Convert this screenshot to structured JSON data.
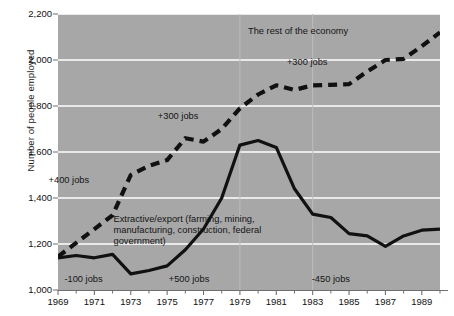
{
  "chart_data": {
    "type": "line",
    "title": "",
    "xlabel": "",
    "ylabel": "Number of people employed",
    "xlim": [
      1969,
      1990
    ],
    "ylim": [
      1000,
      2200
    ],
    "yticks": [
      1000,
      1200,
      1400,
      1600,
      1800,
      2000,
      2200
    ],
    "ytick_labels": [
      "1,000",
      "1,200",
      "1,400",
      "1,600",
      "1,800",
      "2,000",
      "2,200"
    ],
    "xticks": [
      1969,
      1971,
      1973,
      1975,
      1977,
      1979,
      1981,
      1983,
      1985,
      1987,
      1989
    ],
    "xtick_labels": [
      "1969",
      "1971",
      "1973",
      "1975",
      "1977",
      "1979",
      "1981",
      "1983",
      "1985",
      "1987",
      "1989"
    ],
    "xminor_ticks": [
      1970,
      1972,
      1974,
      1976,
      1978,
      1980,
      1982,
      1984,
      1986,
      1988,
      1990
    ],
    "grid": true,
    "grid_color": "#ffffff",
    "plot_background": "#a7a7a7",
    "legend_position": "inline-annotations",
    "x": [
      1969,
      1970,
      1971,
      1972,
      1973,
      1974,
      1975,
      1976,
      1977,
      1978,
      1979,
      1980,
      1981,
      1982,
      1983,
      1984,
      1985,
      1986,
      1987,
      1988,
      1989,
      1990
    ],
    "series": [
      {
        "name": "The rest of the economy",
        "style": "dashed",
        "color": "#111111",
        "values": [
          1145,
          1205,
          1265,
          1325,
          1500,
          1540,
          1565,
          1660,
          1645,
          1700,
          1790,
          1850,
          1890,
          1870,
          1890,
          1892,
          1895,
          1950,
          2000,
          2005,
          2060,
          2120
        ]
      },
      {
        "name": "Extractive/export (farming, mining, manufacturing, construction, federal government)",
        "style": "solid",
        "color": "#111111",
        "values": [
          1140,
          1150,
          1140,
          1155,
          1070,
          1085,
          1105,
          1175,
          1265,
          1400,
          1630,
          1650,
          1620,
          1440,
          1330,
          1315,
          1245,
          1235,
          1190,
          1235,
          1260,
          1265
        ]
      }
    ],
    "annotations": [
      {
        "text": "The rest of the economy",
        "x": 1982.2,
        "y": 2118
      },
      {
        "text": "+300 jobs",
        "x": 1982.7,
        "y": 1985
      },
      {
        "text": "+300 jobs",
        "x": 1975.6,
        "y": 1748
      },
      {
        "text": "+400 jobs",
        "x": 1969.6,
        "y": 1470
      },
      {
        "text": "Extractive/export (farming, mining, manufacturing, construction, federal government)",
        "x": 1977.0,
        "y": 1300
      },
      {
        "text": "-100 jobs",
        "x": 1970.4,
        "y": 1040
      },
      {
        "text": "+500 jobs",
        "x": 1976.2,
        "y": 1040
      },
      {
        "text": "-450 jobs",
        "x": 1984.0,
        "y": 1040
      }
    ]
  },
  "axis": {
    "y_title": "Number of people employed"
  }
}
